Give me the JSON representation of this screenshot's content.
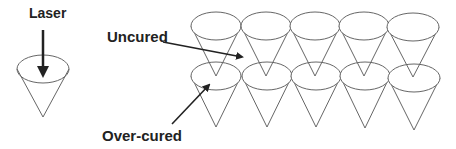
{
  "labels": {
    "laser": "Laser",
    "uncured": "Uncured",
    "overcured": "Over-cured"
  },
  "colors": {
    "outline": "#666666",
    "arrow": "#222222",
    "text": "#222222",
    "background": "#ffffff"
  },
  "single_cone": {
    "cx": 43,
    "cy": 69,
    "rx": 26,
    "ry": 14,
    "apex_y": 117
  },
  "array": {
    "rows": 2,
    "columns": 5,
    "top_row": {
      "cy": 26,
      "apex_y": 76,
      "cx": [
        216,
        266,
        315,
        364,
        413
      ]
    },
    "bottom_row": {
      "cy": 76,
      "apex_y": 127,
      "cx": [
        216,
        267,
        316,
        365,
        414
      ]
    },
    "rx": 25,
    "ry": 14
  }
}
